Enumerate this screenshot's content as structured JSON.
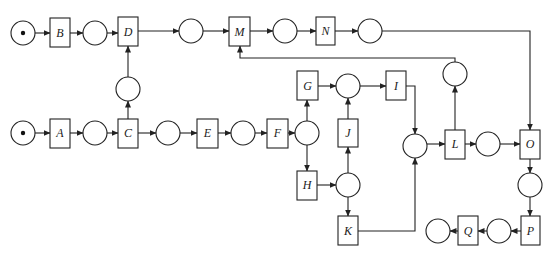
{
  "diagram": {
    "type": "petri-net",
    "colors": {
      "stroke": "#222222",
      "background": "#ffffff",
      "token": "#111111"
    },
    "transitions": [
      {
        "id": "B",
        "label": "B"
      },
      {
        "id": "D",
        "label": "D"
      },
      {
        "id": "M",
        "label": "M"
      },
      {
        "id": "N",
        "label": "N"
      },
      {
        "id": "A",
        "label": "A"
      },
      {
        "id": "C",
        "label": "C"
      },
      {
        "id": "E",
        "label": "E"
      },
      {
        "id": "F",
        "label": "F"
      },
      {
        "id": "G",
        "label": "G"
      },
      {
        "id": "H",
        "label": "H"
      },
      {
        "id": "I",
        "label": "I"
      },
      {
        "id": "J",
        "label": "J"
      },
      {
        "id": "K",
        "label": "K"
      },
      {
        "id": "L",
        "label": "L"
      },
      {
        "id": "O",
        "label": "O"
      },
      {
        "id": "P",
        "label": "P"
      },
      {
        "id": "Q",
        "label": "Q"
      }
    ],
    "places": [
      {
        "id": "p_start_top",
        "tokens": 1
      },
      {
        "id": "p_B_D",
        "tokens": 0
      },
      {
        "id": "p_D_M",
        "tokens": 0
      },
      {
        "id": "p_M_N",
        "tokens": 0
      },
      {
        "id": "p_N_O",
        "tokens": 0
      },
      {
        "id": "p_C_D",
        "tokens": 0
      },
      {
        "id": "p_start_bottom",
        "tokens": 1
      },
      {
        "id": "p_A_C",
        "tokens": 0
      },
      {
        "id": "p_C_E",
        "tokens": 0
      },
      {
        "id": "p_E_F",
        "tokens": 0
      },
      {
        "id": "p_F_GH",
        "tokens": 0
      },
      {
        "id": "p_GJ_I",
        "tokens": 0
      },
      {
        "id": "p_H_JK",
        "tokens": 0
      },
      {
        "id": "p_IK_L",
        "tokens": 0
      },
      {
        "id": "p_L_M",
        "tokens": 0
      },
      {
        "id": "p_L_O",
        "tokens": 0
      },
      {
        "id": "p_O_P",
        "tokens": 0
      },
      {
        "id": "p_P_Q",
        "tokens": 0
      },
      {
        "id": "p_end",
        "tokens": 0
      }
    ],
    "arcs": [
      "p_start_top->B",
      "B->p_B_D",
      "p_B_D->D",
      "D->p_D_M",
      "p_D_M->M",
      "M->p_M_N",
      "p_M_N->N",
      "N->p_N_O",
      "p_N_O->O",
      "p_start_bottom->A",
      "A->p_A_C",
      "p_A_C->C",
      "C->p_C_D",
      "p_C_D->D",
      "C->p_C_E",
      "p_C_E->E",
      "E->p_E_F",
      "p_E_F->F",
      "F->p_F_GH",
      "p_F_GH->G",
      "p_F_GH->H",
      "G->p_GJ_I",
      "H->p_H_JK",
      "p_H_JK->J",
      "p_H_JK->K",
      "J->p_GJ_I",
      "p_GJ_I->I",
      "I->p_IK_L",
      "K->p_IK_L",
      "p_IK_L->L",
      "L->p_L_M",
      "p_L_M->M",
      "L->p_L_O",
      "p_L_O->O",
      "O->p_O_P",
      "p_O_P->P",
      "P->p_P_Q",
      "p_P_Q->Q",
      "Q->p_end"
    ]
  }
}
